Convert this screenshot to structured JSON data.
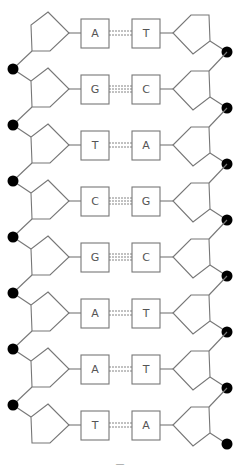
{
  "diagram": {
    "type": "dna-double-helix-ladder",
    "colors": {
      "stroke": "#777777",
      "phosphate": "#000000",
      "background": "#ffffff",
      "text": "#555555"
    },
    "row_start_y": 33,
    "row_pitch": 56,
    "base_pairs": [
      {
        "left": "A",
        "right": "T",
        "hydrogen_bonds": 2
      },
      {
        "left": "G",
        "right": "C",
        "hydrogen_bonds": 3
      },
      {
        "left": "T",
        "right": "A",
        "hydrogen_bonds": 2
      },
      {
        "left": "C",
        "right": "G",
        "hydrogen_bonds": 3
      },
      {
        "left": "G",
        "right": "C",
        "hydrogen_bonds": 3
      },
      {
        "left": "A",
        "right": "T",
        "hydrogen_bonds": 2
      },
      {
        "left": "A",
        "right": "T",
        "hydrogen_bonds": 2
      },
      {
        "left": "T",
        "right": "A",
        "hydrogen_bonds": 2
      }
    ]
  },
  "caption": "—"
}
